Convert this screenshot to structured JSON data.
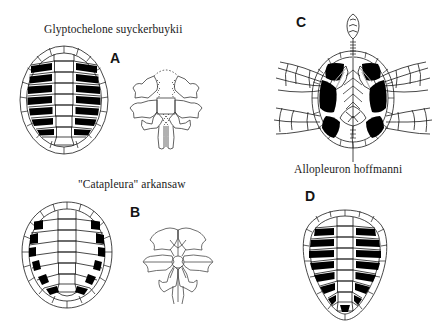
{
  "figure": {
    "width": 438,
    "height": 328,
    "background_color": "#ffffff",
    "ink_color": "#1a1a1a",
    "fill_color": "#000000"
  },
  "captions": {
    "glyptochelone": "Glyptochelone suyckerbuykii",
    "catapleura": "\"Catapleura\" arkansaw",
    "allopleuron": "Allopleuron hoffmanni"
  },
  "panels": [
    {
      "letter": "A",
      "taxon": "Glyptochelone suyckerbuykii",
      "views": [
        "carapace-dorsal",
        "skull-dorsal"
      ],
      "shell_shape": "oval",
      "fontanelle_fills": "black costal fontanelles, 7 per side"
    },
    {
      "letter": "B",
      "taxon": "\"Catapleura\" arkansaw",
      "views": [
        "carapace-dorsal",
        "skull-dorsal"
      ],
      "shell_shape": "rounded-oval",
      "fontanelle_fills": "black marginal fontanelles, 6 per side"
    },
    {
      "letter": "C",
      "taxon": "Allopleuron hoffmanni",
      "views": [
        "skeleton-dorsal"
      ],
      "shell_shape": "oval with splayed fore- and hind-limbs, skull and tail",
      "fontanelle_fills": "large black costal fontanelles"
    },
    {
      "letter": "D",
      "taxon": "Allopleuron hoffmanni",
      "views": [
        "carapace-dorsal"
      ],
      "shell_shape": "heart-shaped",
      "fontanelle_fills": "broad black costal fontanelles, 8 per side"
    }
  ],
  "icons": {
    "carapace": "turtle-carapace-icon",
    "skull": "turtle-skull-icon",
    "skeleton": "turtle-skeleton-icon"
  }
}
